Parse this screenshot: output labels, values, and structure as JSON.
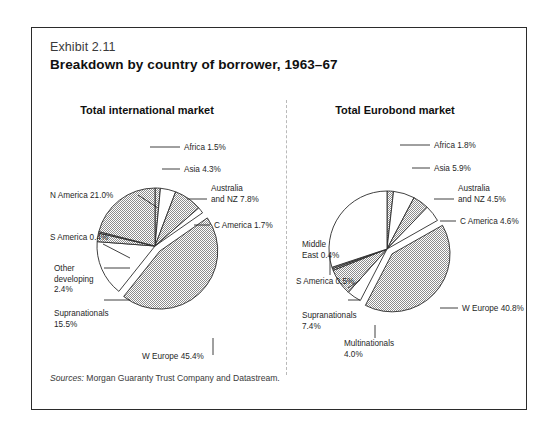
{
  "exhibit": {
    "number": "Exhibit 2.11",
    "title": "Breakdown by country of borrower, 1963–67",
    "source_word": "Sources:",
    "source_text": " Morgan Guaranty Trust Company and Datastream."
  },
  "colors": {
    "gray_fill": "#b4b4b4",
    "white_fill": "#ffffff",
    "outline": "#2b2b2b",
    "divider": "#b9b9b9",
    "frame": "#2b2b2b"
  },
  "chart_data": [
    {
      "type": "pie",
      "title": "Total international market",
      "start_angle": 0,
      "direction": "clockwise",
      "exploded": [
        "W Europe"
      ],
      "slices": [
        {
          "label": "Africa",
          "value": 1.5,
          "label_text": "Africa 1.5%",
          "fill": "gray"
        },
        {
          "label": "Asia",
          "value": 4.3,
          "label_text": "Asia 4.3%",
          "fill": "white"
        },
        {
          "label": "Australia and NZ",
          "value": 7.8,
          "label_text": "Australia and NZ 7.8%",
          "fill": "gray"
        },
        {
          "label": "C America",
          "value": 1.7,
          "label_text": "C America 1.7%",
          "fill": "white"
        },
        {
          "label": "W Europe",
          "value": 45.4,
          "label_text": "W Europe 45.4%",
          "fill": "gray"
        },
        {
          "label": "Supranationals",
          "value": 15.5,
          "label_text": "Supranationals 15.5%",
          "fill": "white"
        },
        {
          "label": "Other developing",
          "value": 2.4,
          "label_text": "Other developing 2.4%",
          "fill": "gray"
        },
        {
          "label": "S America",
          "value": 0.4,
          "label_text": "S America 0.4%",
          "fill": "gray"
        },
        {
          "label": "N America",
          "value": 21.0,
          "label_text": "N America 21.0%",
          "fill": "gray"
        }
      ]
    },
    {
      "type": "pie",
      "title": "Total Eurobond market",
      "start_angle": 0,
      "direction": "clockwise",
      "exploded": [
        "W Europe"
      ],
      "slices": [
        {
          "label": "Africa",
          "value": 1.8,
          "label_text": "Africa 1.8%",
          "fill": "gray"
        },
        {
          "label": "Asia",
          "value": 5.9,
          "label_text": "Asia 5.9%",
          "fill": "white"
        },
        {
          "label": "Australia and NZ",
          "value": 4.5,
          "label_text": "Australia and NZ 4.5%",
          "fill": "gray"
        },
        {
          "label": "C America",
          "value": 4.6,
          "label_text": "C America 4.6%",
          "fill": "white"
        },
        {
          "label": "W Europe",
          "value": 40.8,
          "label_text": "W Europe 40.8%",
          "fill": "gray"
        },
        {
          "label": "Multinationals",
          "value": 4.0,
          "label_text": "Multinationals 4.0%",
          "fill": "white"
        },
        {
          "label": "Supranationals",
          "value": 7.4,
          "label_text": "Supranationals 7.4%",
          "fill": "gray"
        },
        {
          "label": "S America",
          "value": 0.5,
          "label_text": "S America 0.5%",
          "fill": "gray"
        },
        {
          "label": "Middle East",
          "value": 0.4,
          "label_text": "Middle East 0.4%",
          "fill": "gray"
        },
        {
          "label": "N America",
          "value": 30.1,
          "label_text": "N America 30.1%",
          "fill": "white"
        }
      ]
    }
  ],
  "labels_left": [
    {
      "name": "africa",
      "lines": [
        "Africa 1.5%"
      ],
      "x": 152,
      "y": 122,
      "anchor": "start",
      "elbow": [
        118,
        119,
        148,
        119
      ]
    },
    {
      "name": "asia",
      "lines": [
        "Asia 4.3%"
      ],
      "x": 152,
      "y": 144,
      "anchor": "start",
      "elbow": [
        130,
        141,
        148,
        141
      ]
    },
    {
      "name": "australia-nz",
      "lines": [
        "Australia",
        "and NZ 7.8%"
      ],
      "x": 179,
      "y": 163,
      "anchor": "start",
      "elbow": [
        155,
        171,
        175,
        171
      ]
    },
    {
      "name": "c-america",
      "lines": [
        "C America 1.7%"
      ],
      "x": 182,
      "y": 200,
      "anchor": "start",
      "elbow": [
        162,
        197,
        178,
        197
      ]
    },
    {
      "name": "w-europe",
      "lines": [
        "W Europe 45.4%"
      ],
      "x": 110,
      "y": 331,
      "anchor": "start",
      "elbow": [
        181,
        310,
        181,
        327
      ]
    },
    {
      "name": "supranationals",
      "lines": [
        "Supranationals",
        "15.5%"
      ],
      "x": 22,
      "y": 288,
      "anchor": "start",
      "elbow": [
        72,
        272,
        98,
        272
      ]
    },
    {
      "name": "other-developing",
      "lines": [
        "Other",
        "developing",
        "2.4%"
      ],
      "x": 22,
      "y": 243,
      "anchor": "start",
      "elbow": [
        72,
        240,
        98,
        240
      ]
    },
    {
      "name": "s-america",
      "lines": [
        "S America 0.4%"
      ],
      "x": 18,
      "y": 212,
      "anchor": "start",
      "elbow": [
        71,
        216,
        98,
        230
      ]
    },
    {
      "name": "n-america",
      "lines": [
        "N America 21.0%"
      ],
      "x": 18,
      "y": 170,
      "anchor": "start",
      "elbow": [
        106,
        167,
        126,
        180
      ]
    }
  ],
  "labels_right": [
    {
      "name": "africa",
      "lines": [
        "Africa 1.8%"
      ],
      "x": 152,
      "y": 120,
      "anchor": "start",
      "elbow": [
        118,
        117,
        148,
        117
      ]
    },
    {
      "name": "asia",
      "lines": [
        "Asia 5.9%"
      ],
      "x": 152,
      "y": 143,
      "anchor": "start",
      "elbow": [
        130,
        140,
        148,
        140
      ]
    },
    {
      "name": "australia-nz",
      "lines": [
        "Australia",
        "and NZ 4.5%"
      ],
      "x": 176,
      "y": 163,
      "anchor": "start",
      "elbow": [
        152,
        171,
        172,
        171
      ]
    },
    {
      "name": "c-america",
      "lines": [
        "C America 4.6%"
      ],
      "x": 178,
      "y": 196,
      "anchor": "start",
      "elbow": [
        158,
        193,
        174,
        193
      ]
    },
    {
      "name": "w-europe",
      "lines": [
        "W Europe 40.8%"
      ],
      "x": 180,
      "y": 283,
      "anchor": "start",
      "elbow": [
        158,
        280,
        176,
        280
      ]
    },
    {
      "name": "multinationals",
      "lines": [
        "Multinationals",
        "4.0%"
      ],
      "x": 62,
      "y": 318,
      "anchor": "start",
      "elbow": [
        93,
        297,
        93,
        310
      ]
    },
    {
      "name": "supranationals",
      "lines": [
        "Supranationals",
        "7.4%"
      ],
      "x": 20,
      "y": 290,
      "anchor": "start",
      "elbow": [
        66,
        272,
        78,
        272
      ]
    },
    {
      "name": "s-america",
      "lines": [
        "S America 0.5%"
      ],
      "x": 14,
      "y": 256,
      "anchor": "start",
      "elbow": [
        66,
        260,
        78,
        252
      ]
    },
    {
      "name": "middle-east",
      "lines": [
        "Middle",
        "East 0.4%"
      ],
      "x": 20,
      "y": 219,
      "anchor": "start",
      "elbow": [
        48,
        227,
        48,
        247
      ]
    }
  ]
}
